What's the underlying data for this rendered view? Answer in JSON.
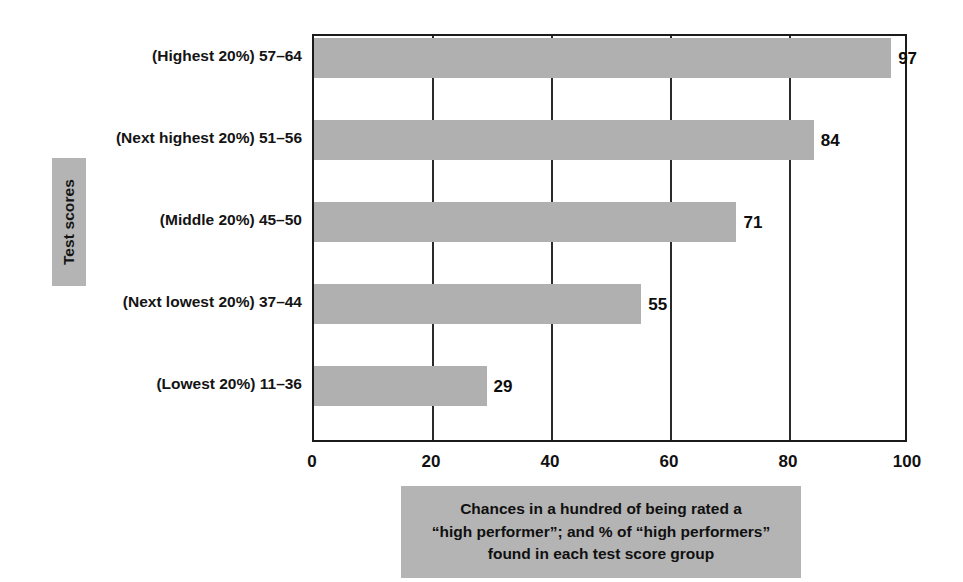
{
  "axis_group_label": "Test scores",
  "caption_lines": [
    "Chances in a hundred of being rated a",
    "“high performer”; and % of “high performers”",
    "found in each test score group"
  ],
  "colors": {
    "bar_fill": "#b0b0b0",
    "panel_fill": "#b4b4b4",
    "axis": "#1b1b1b",
    "text": "#111111",
    "background": "#ffffff"
  },
  "chart_data": {
    "type": "bar",
    "orientation": "horizontal",
    "title": "",
    "subtitle": "",
    "xlabel": "Chances in a hundred of being rated a “high performer”; and % of “high performers” found in each test score group",
    "ylabel": "Test scores",
    "categories": [
      "(Highest 20%) 57–64",
      "(Next highest 20%) 51–56",
      "(Middle 20%) 45–50",
      "(Next lowest 20%) 37–44",
      "(Lowest 20%) 11–36"
    ],
    "values": [
      97,
      84,
      71,
      55,
      29
    ],
    "value_labels": [
      "97",
      "84",
      "71",
      "55",
      "29"
    ],
    "xlim": [
      0,
      100
    ],
    "xticks": [
      0,
      20,
      40,
      60,
      80,
      100
    ],
    "xtick_labels": [
      "0",
      "20",
      "40",
      "60",
      "80",
      "100"
    ],
    "grid": "vertical",
    "legend": "none"
  }
}
